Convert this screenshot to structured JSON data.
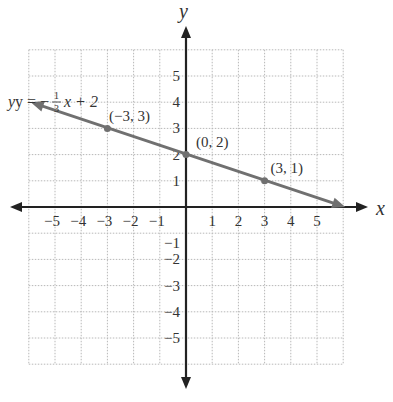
{
  "chart_data": {
    "type": "line",
    "title": "",
    "xlabel": "x",
    "ylabel": "y",
    "xlim": [
      -6,
      6
    ],
    "ylim": [
      -6,
      6
    ],
    "grid": true,
    "x_ticks": [
      -5,
      -4,
      -3,
      -2,
      -1,
      1,
      2,
      3,
      4,
      5
    ],
    "y_ticks": [
      -5,
      -4,
      -3,
      -2,
      -1,
      1,
      2,
      3,
      4,
      5
    ],
    "x_tick_labels": [
      "−5",
      "−4",
      "−3",
      "−2",
      "−1",
      "1",
      "2",
      "3",
      "4",
      "5"
    ],
    "y_tick_labels": [
      "−5",
      "−4",
      "−3",
      "−2",
      "−1",
      "1",
      "2",
      "3",
      "4",
      "5"
    ],
    "series": [
      {
        "name": "y = −1/3 x + 2",
        "equation_label": "y = −",
        "slope_num": "1",
        "slope_den": "3",
        "equation_suffix": "x + 2",
        "color": "#707070",
        "x": [
          -6,
          6
        ],
        "y": [
          4,
          0
        ],
        "points": [
          {
            "x": -3,
            "y": 3,
            "label": "(−3, 3)"
          },
          {
            "x": 0,
            "y": 2,
            "label": "(0, 2)"
          },
          {
            "x": 3,
            "y": 1,
            "label": "(3, 1)"
          }
        ]
      }
    ]
  }
}
